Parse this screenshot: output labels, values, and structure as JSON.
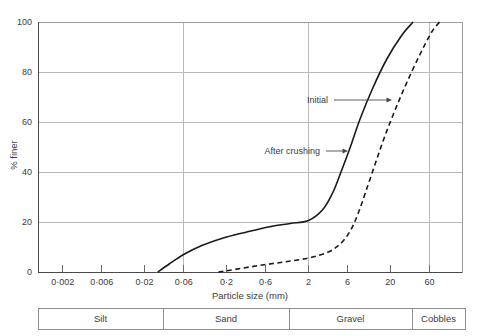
{
  "chart_data": {
    "type": "line",
    "title": "",
    "xlabel": "Particle size (mm)",
    "ylabel": "% finer",
    "xscale": "log",
    "xlim": [
      0.001,
      150
    ],
    "ylim": [
      0,
      100
    ],
    "grid": true,
    "legend_position": "inline-annotations",
    "xticks": [
      {
        "value": 0.002,
        "label": "0·002"
      },
      {
        "value": 0.006,
        "label": "0·006"
      },
      {
        "value": 0.02,
        "label": "0·02"
      },
      {
        "value": 0.06,
        "label": "0·06"
      },
      {
        "value": 0.2,
        "label": "0·2"
      },
      {
        "value": 0.6,
        "label": "0·6"
      },
      {
        "value": 2,
        "label": "2"
      },
      {
        "value": 6,
        "label": "6"
      },
      {
        "value": 20,
        "label": "20"
      },
      {
        "value": 60,
        "label": "60"
      }
    ],
    "yticks": [
      {
        "value": 0,
        "label": "0"
      },
      {
        "value": 20,
        "label": "20"
      },
      {
        "value": 40,
        "label": "40"
      },
      {
        "value": 60,
        "label": "60"
      },
      {
        "value": 80,
        "label": "80"
      },
      {
        "value": 100,
        "label": "100"
      }
    ],
    "gridlines_x": [
      0.06,
      2,
      60
    ],
    "gridlines_y": [
      20,
      40,
      60,
      80,
      100
    ],
    "series": [
      {
        "name": "After crushing",
        "style": "solid",
        "points": [
          [
            0.029,
            0
          ],
          [
            0.04,
            3.2
          ],
          [
            0.06,
            7.0
          ],
          [
            0.1,
            10.6
          ],
          [
            0.2,
            14.0
          ],
          [
            0.4,
            16.4
          ],
          [
            0.7,
            18.2
          ],
          [
            1.2,
            19.4
          ],
          [
            2.0,
            20.6
          ],
          [
            3.0,
            25.0
          ],
          [
            4.0,
            32.0
          ],
          [
            5.0,
            40.0
          ],
          [
            6.5,
            50.0
          ],
          [
            8.5,
            61.0
          ],
          [
            12,
            73.0
          ],
          [
            18,
            85.0
          ],
          [
            28,
            95.0
          ],
          [
            38,
            100
          ]
        ]
      },
      {
        "name": "Initial",
        "style": "dashed",
        "points": [
          [
            0.16,
            0
          ],
          [
            0.25,
            1.0
          ],
          [
            0.5,
            2.6
          ],
          [
            1.0,
            4.0
          ],
          [
            2.0,
            5.6
          ],
          [
            3.5,
            8.0
          ],
          [
            5.0,
            11.5
          ],
          [
            6.5,
            16.5
          ],
          [
            8.0,
            23.0
          ],
          [
            10,
            32.0
          ],
          [
            13,
            43.0
          ],
          [
            17,
            54.0
          ],
          [
            23,
            65.0
          ],
          [
            32,
            76.0
          ],
          [
            46,
            87.0
          ],
          [
            64,
            96.0
          ],
          [
            80,
            100
          ]
        ]
      }
    ],
    "annotations": [
      {
        "text": "Initial",
        "label_x": 330,
        "label_y": 103,
        "leader_from_x": 334,
        "leader_to_x": 392,
        "leader_y": 100,
        "target_series": "Initial"
      },
      {
        "text": "After crushing",
        "label_x": 256,
        "label_y": 154,
        "leader_from_x": 326,
        "leader_to_x": 348,
        "leader_y": 151,
        "target_series": "After crushing"
      }
    ],
    "classification_bar": {
      "cells": [
        {
          "label": "Silt",
          "x": 38,
          "width": 125
        },
        {
          "label": "Sand",
          "x": 163,
          "width": 126
        },
        {
          "label": "Gravel",
          "x": 289,
          "width": 123
        },
        {
          "label": "Cobbles",
          "x": 412,
          "width": 53
        }
      ]
    }
  }
}
